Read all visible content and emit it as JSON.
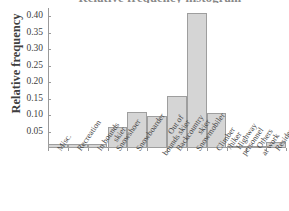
{
  "chart_data": {
    "type": "bar",
    "title": "Relative frequency histogram",
    "xlabel": "",
    "ylabel": "Relative frequency",
    "ylim": [
      0,
      0.425
    ],
    "yticks": [
      "0.05",
      "0.10",
      "0.15",
      "0.20",
      "0.25",
      "0.30",
      "0.35",
      "0.40"
    ],
    "ytick_values": [
      0.05,
      0.1,
      0.15,
      0.2,
      0.25,
      0.3,
      0.35,
      0.4
    ],
    "grid": false,
    "legend": "none",
    "categories": [
      "Misc.",
      "Recreation",
      "In bounds skier",
      "Snowshoer",
      "Snowboarder",
      "Out of bounds skier",
      "Backcountry skier",
      "Snowmobiler",
      "Climber /hiker",
      "Highway personnel",
      "Others at work",
      "Resident"
    ],
    "category_lines": [
      [
        "Misc."
      ],
      [
        "Recreation"
      ],
      [
        "In bounds",
        "skier"
      ],
      [
        "Snowshoer"
      ],
      [
        "Snowboarder"
      ],
      [
        "Out of",
        "bounds skier"
      ],
      [
        "Backcountry",
        "skier"
      ],
      [
        "Snowmobiler"
      ],
      [
        "Climber",
        "/hiker"
      ],
      [
        "Highway",
        "personnel"
      ],
      [
        "Others",
        "at work"
      ],
      [
        "Resident"
      ]
    ],
    "values": [
      0.012,
      0.012,
      0.012,
      0.065,
      0.11,
      0.098,
      0.158,
      0.41,
      0.105,
      0.002,
      0.005,
      0.018
    ],
    "bar_color": "#d5d5d5",
    "bar_edge_color": "#9e9e9e",
    "axis_color": "#9a9a9a",
    "text_color": "#3f3f3f"
  }
}
